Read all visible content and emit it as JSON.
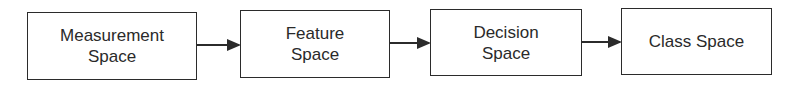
{
  "diagram": {
    "type": "flowchart",
    "direction": "left-to-right",
    "nodes": [
      {
        "id": "measurement",
        "label_lines": [
          "Measurement",
          "Space"
        ]
      },
      {
        "id": "feature",
        "label_lines": [
          "Feature",
          "Space"
        ]
      },
      {
        "id": "decision",
        "label_lines": [
          "Decision",
          "Space"
        ]
      },
      {
        "id": "class",
        "label_lines": [
          "Class Space"
        ]
      }
    ],
    "edges": [
      {
        "from": "measurement",
        "to": "feature"
      },
      {
        "from": "feature",
        "to": "decision"
      },
      {
        "from": "decision",
        "to": "class"
      }
    ],
    "colors": {
      "stroke": "#2b2b2b",
      "text": "#2a2a2a",
      "background": "#ffffff"
    }
  }
}
